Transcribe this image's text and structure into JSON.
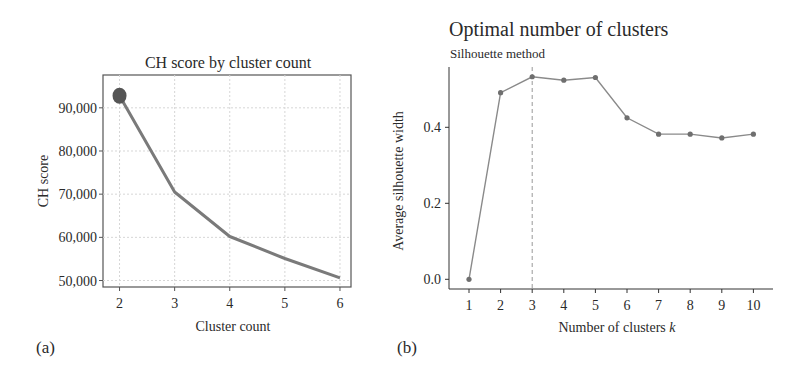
{
  "chart_data": [
    {
      "panel_label": "(a)",
      "type": "line",
      "title": "CH score by cluster count",
      "xlabel": "Cluster count",
      "ylabel": "CH score",
      "x": [
        2,
        3,
        4,
        5,
        6
      ],
      "values": [
        92800,
        70500,
        60200,
        55100,
        50600
      ],
      "xticks": [
        "2",
        "3",
        "4",
        "5",
        "6"
      ],
      "yticks": [
        "50,000",
        "60,000",
        "70,000",
        "80,000",
        "90,000"
      ],
      "ytick_values": [
        50000,
        60000,
        70000,
        80000,
        90000
      ],
      "xlim": [
        1.7,
        6.2
      ],
      "ylim": [
        48500,
        97600
      ],
      "grid": true,
      "highlight": {
        "x": 2,
        "value": 92800,
        "marker": "large-dot"
      },
      "line_color": "#7a7a7a",
      "marker_color": "#555555"
    },
    {
      "panel_label": "(b)",
      "type": "line",
      "title": "Optimal number of clusters",
      "subtitle": "Silhouette method",
      "xlabel": "Number of clusters k",
      "xlabel_main": "Number of clusters ",
      "xlabel_italic": "k",
      "ylabel": "Average silhouette width",
      "x": [
        1,
        2,
        3,
        4,
        5,
        6,
        7,
        8,
        9,
        10
      ],
      "values": [
        0.0,
        0.491,
        0.533,
        0.524,
        0.531,
        0.425,
        0.382,
        0.382,
        0.372,
        0.382
      ],
      "xticks": [
        "1",
        "2",
        "3",
        "4",
        "5",
        "6",
        "7",
        "8",
        "9",
        "10"
      ],
      "yticks": [
        "0.0",
        "0.2",
        "0.4"
      ],
      "ytick_values": [
        0.0,
        0.2,
        0.4
      ],
      "xlim": [
        0.4,
        10.6
      ],
      "ylim": [
        -0.025,
        0.56
      ],
      "grid": false,
      "vline": {
        "x": 3,
        "style": "dashed"
      },
      "line_color": "#8a8a8a",
      "marker_color": "#6f6f6f"
    }
  ]
}
